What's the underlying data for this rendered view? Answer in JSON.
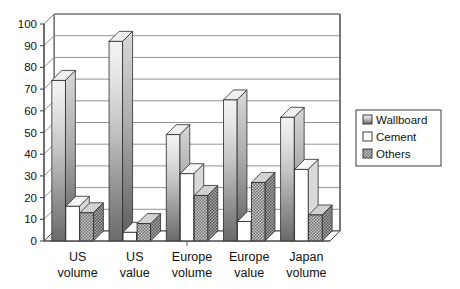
{
  "chart_data": {
    "type": "bar",
    "title": "",
    "subtitle": "",
    "xlabel": "",
    "ylabel": "",
    "ylim": [
      0,
      100
    ],
    "ytick_step": 10,
    "yticks": [
      "0",
      "10",
      "20",
      "30",
      "40",
      "50",
      "60",
      "70",
      "80",
      "90",
      "100"
    ],
    "grid": true,
    "grid_axis": "y",
    "style": "3d-clustered-column",
    "legend_position": "right",
    "categories": [
      "US volume",
      "US value",
      "Europe volume",
      "Europe value",
      "Japan volume"
    ],
    "category_lines": [
      [
        "US",
        "volume"
      ],
      [
        "US",
        "value"
      ],
      [
        "Europe",
        "volume"
      ],
      [
        "Europe",
        "value"
      ],
      [
        "Japan",
        "volume"
      ]
    ],
    "series": [
      {
        "name": "Wallboard",
        "values": [
          74,
          92,
          49,
          65,
          57
        ],
        "fill": "gradient-gray",
        "swatch": "gradient-gray"
      },
      {
        "name": "Cement",
        "values": [
          16,
          4,
          31,
          9,
          33
        ],
        "fill": "white",
        "swatch": "white"
      },
      {
        "name": "Others",
        "values": [
          13,
          8,
          21,
          27,
          12
        ],
        "fill": "dither-gray",
        "swatch": "dither-gray"
      }
    ]
  },
  "legend": {
    "entries": [
      {
        "label": "Wallboard"
      },
      {
        "label": "Cement"
      },
      {
        "label": "Others"
      }
    ]
  },
  "colors": {
    "axis": "#4a4a4a",
    "grid": "#888888",
    "bar_outline": "#2b2b2b",
    "wallboard_top": "#f2f2f2",
    "wallboard_bottom": "#6f6f6f",
    "cement": "#ffffff",
    "others": "#9a9a9a",
    "background": "#ffffff",
    "text": "#111111"
  }
}
